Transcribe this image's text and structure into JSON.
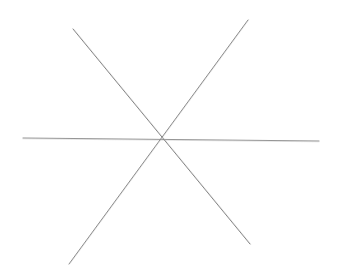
{
  "canvas": {
    "width": 337,
    "height": 279,
    "background_color": "#ffffff",
    "figure_name": "six-pointed asterisk",
    "medium": "pencil line drawing"
  },
  "chart_data": {
    "type": "scatter",
    "title": "",
    "subtitle": "",
    "xlabel": "",
    "ylabel": "",
    "xlim": [
      0,
      337
    ],
    "ylim": [
      0,
      279
    ],
    "grid": false,
    "legend": "none",
    "center_point": {
      "x": 162,
      "y": 140
    },
    "series": [
      {
        "name": "horizontal-stroke",
        "x": [
          23,
          319
        ],
        "y": [
          138,
          141
        ],
        "angle_deg": 0.6,
        "length_px": 296,
        "color": "#8d8d8d",
        "width_px": 1.0
      },
      {
        "name": "descending-diagonal-stroke",
        "x": [
          73,
          250
        ],
        "y": [
          29,
          244
        ],
        "angle_deg": 50.5,
        "length_px": 278,
        "color": "#7a7a7a",
        "width_px": 1.0
      },
      {
        "name": "ascending-diagonal-stroke",
        "x": [
          69,
          248
        ],
        "y": [
          264,
          20
        ],
        "angle_deg": -53.7,
        "length_px": 303,
        "color": "#828282",
        "width_px": 1.0
      }
    ],
    "endpoints": [
      {
        "label": "left",
        "x": 23,
        "y": 138
      },
      {
        "label": "right",
        "x": 319,
        "y": 141
      },
      {
        "label": "upper-left",
        "x": 73,
        "y": 29
      },
      {
        "label": "lower-right",
        "x": 250,
        "y": 244
      },
      {
        "label": "lower-left",
        "x": 69,
        "y": 264
      },
      {
        "label": "upper-right",
        "x": 248,
        "y": 20
      }
    ]
  },
  "colors": {
    "background": "#ffffff",
    "stroke_light": "#9b9b9b",
    "stroke_mid": "#838383",
    "stroke_dark": "#6c6c6c"
  }
}
